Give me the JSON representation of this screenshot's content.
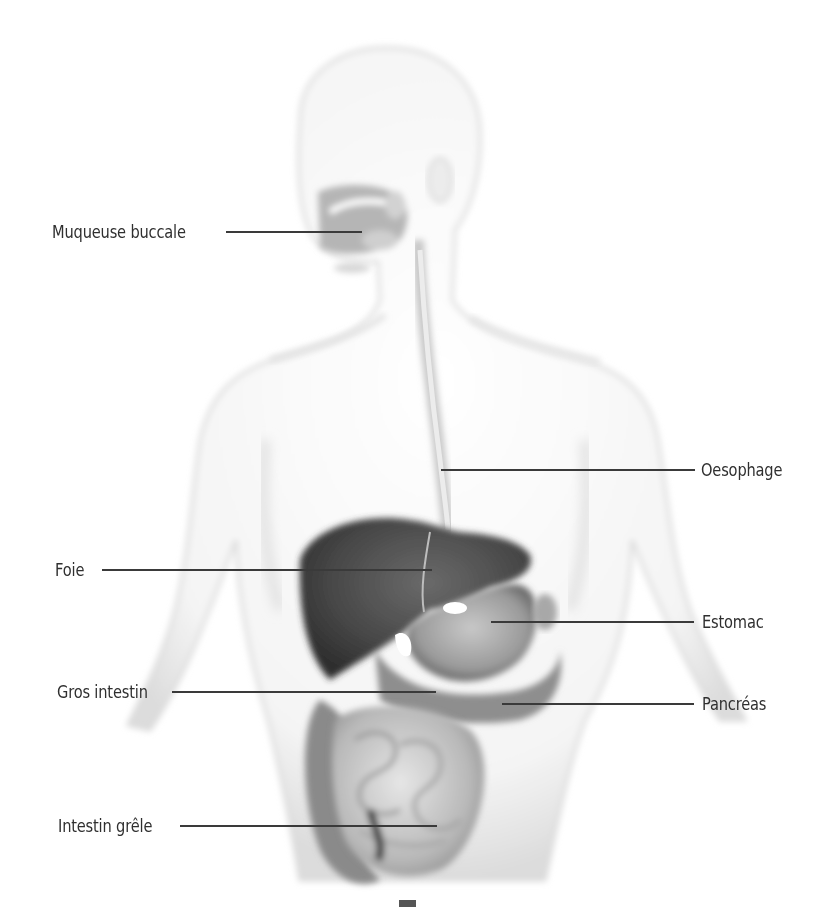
{
  "diagram": {
    "labels": [
      {
        "id": "muqueuse-buccale",
        "text": "Muqueuse buccale",
        "side": "left",
        "text_x": 52,
        "text_y": 222,
        "line_x1": 226,
        "line_x2": 362,
        "line_y": 232
      },
      {
        "id": "oesophage",
        "text": "Oesophage",
        "side": "right",
        "text_x": 701,
        "text_y": 460,
        "line_x1": 441,
        "line_x2": 695,
        "line_y": 470
      },
      {
        "id": "foie",
        "text": "Foie",
        "side": "left",
        "text_x": 55,
        "text_y": 560,
        "line_x1": 102,
        "line_x2": 432,
        "line_y": 570
      },
      {
        "id": "estomac",
        "text": "Estomac",
        "side": "right",
        "text_x": 702,
        "text_y": 612,
        "line_x1": 491,
        "line_x2": 694,
        "line_y": 622
      },
      {
        "id": "gros-intestin",
        "text": "Gros intestin",
        "side": "left",
        "text_x": 57,
        "text_y": 682,
        "line_x1": 172,
        "line_x2": 436,
        "line_y": 692
      },
      {
        "id": "pancreas",
        "text": "Pancréas",
        "side": "right",
        "text_x": 702,
        "text_y": 694,
        "line_x1": 502,
        "line_x2": 694,
        "line_y": 704
      },
      {
        "id": "intestin-grele",
        "text": "Intestin grêle",
        "side": "left",
        "text_x": 58,
        "text_y": 816,
        "line_x1": 180,
        "line_x2": 437,
        "line_y": 826
      }
    ],
    "colors": {
      "background": "#ffffff",
      "body_outline": "#d4d4d4",
      "organs_dark": "#3c3c3c",
      "organs_mid": "#8a8a8a",
      "leader_line": "#3a3a3a",
      "label_text": "#2f2f2f"
    }
  }
}
